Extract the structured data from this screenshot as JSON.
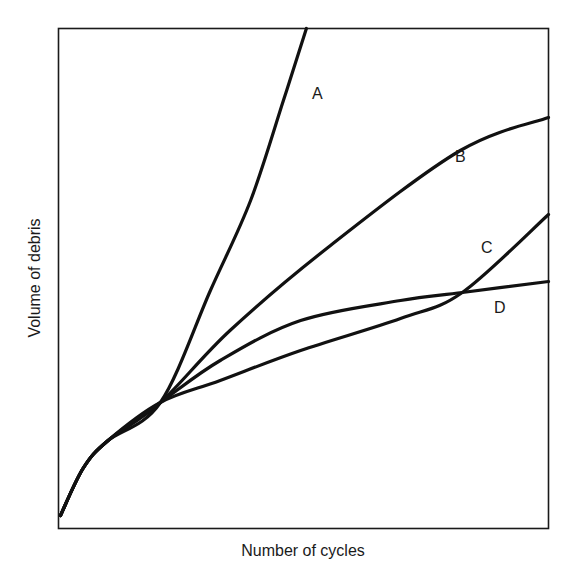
{
  "chart_data": {
    "type": "line",
    "title": "",
    "xlabel": "Number of cycles",
    "ylabel": "Volume of debris",
    "xlim": [
      0,
      100
    ],
    "ylim": [
      0,
      100
    ],
    "grid": false,
    "ticks": false,
    "legend": "inline labels",
    "note": "Qualitative schematic; no numeric ticks. Values are normalized to plot frame (0-100).",
    "series": [
      {
        "name": "A",
        "x": [
          0.4,
          5,
          10,
          20.8,
          31.0,
          39.2,
          45.9,
          50.6
        ],
        "y": [
          2.6,
          12,
          17.5,
          25.2,
          47.6,
          65.6,
          85.6,
          100
        ],
        "label_pos": [
          52.5,
          87
        ]
      },
      {
        "name": "B",
        "x": [
          0.4,
          5,
          10,
          20.8,
          35,
          55.5,
          82,
          100
        ],
        "y": [
          2.6,
          12,
          17.5,
          25.2,
          39.6,
          56.6,
          75.6,
          82.2
        ],
        "label_pos": [
          80.5,
          73.5
        ]
      },
      {
        "name": "C",
        "x": [
          0.4,
          5,
          10,
          20.8,
          33,
          49.4,
          69.8,
          82.4,
          100
        ],
        "y": [
          2.6,
          12,
          17.5,
          25.2,
          29.6,
          35.6,
          42,
          47.2,
          62.8
        ],
        "label_pos": [
          86.5,
          55
        ]
      },
      {
        "name": "D",
        "x": [
          0.4,
          5,
          10,
          20.8,
          33,
          49.4,
          69.8,
          82.4,
          100
        ],
        "y": [
          2.6,
          12,
          17.5,
          25.2,
          33.6,
          41.6,
          45.6,
          47.2,
          49.4
        ],
        "label_pos": [
          89,
          42.5
        ]
      }
    ],
    "annotations": [
      "A",
      "B",
      "C",
      "D"
    ]
  },
  "labels": {
    "x_axis": "Number of cycles",
    "y_axis": "Volume of debris",
    "curve_a": "A",
    "curve_b": "B",
    "curve_c": "C",
    "curve_d": "D"
  }
}
